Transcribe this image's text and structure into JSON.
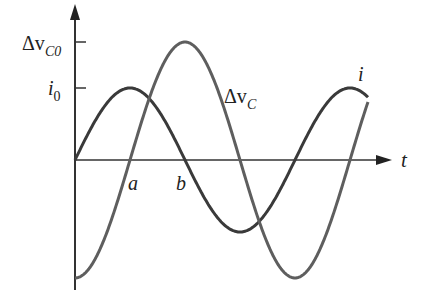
{
  "figure": {
    "y_axis": {
      "ticks": [
        {
          "label": "Δv",
          "sub": "C0",
          "y": 42
        },
        {
          "label": "i",
          "sub": "0",
          "y": 88
        }
      ]
    },
    "x_axis": {
      "label": "t"
    },
    "points": {
      "a": "a",
      "b": "b"
    },
    "curves": {
      "i": {
        "label": "i",
        "amplitude_px": 72,
        "color": "#3a3a3a"
      },
      "dvc": {
        "label": "Δv",
        "sub": "C",
        "amplitude_px": 118,
        "color": "#5a5a5a"
      }
    }
  },
  "chart_data": {
    "type": "line",
    "title": "",
    "xlabel": "t",
    "ylabel": "",
    "series": [
      {
        "name": "i",
        "shape": "sine",
        "amplitude": "i0",
        "phase": "starts at 0, rising"
      },
      {
        "name": "Δv_C",
        "shape": "-cosine",
        "amplitude": "Δv_C0",
        "phase": "starts at -Δv_C0"
      }
    ],
    "annotations": [
      "a",
      "b",
      "i0",
      "Δv_C0"
    ]
  }
}
